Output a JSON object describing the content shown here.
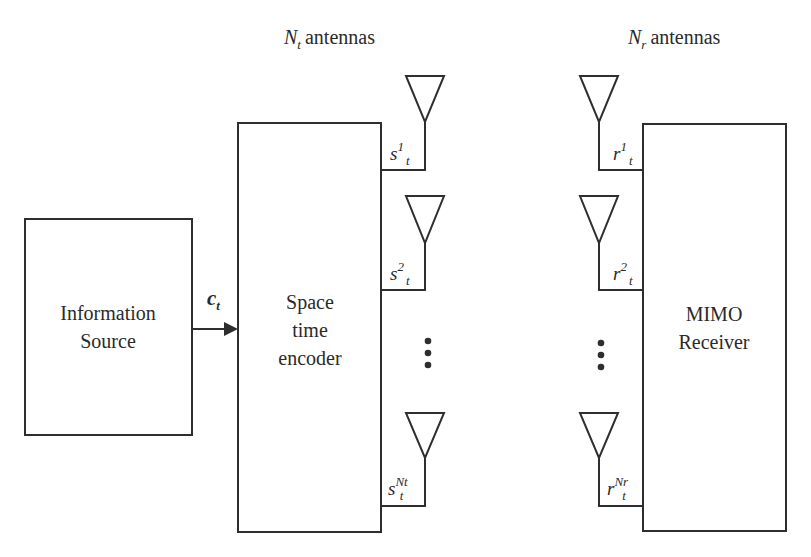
{
  "header": {
    "tx_antennas": {
      "symbol": "N",
      "subscript": "t",
      "text": "antennas"
    },
    "rx_antennas": {
      "symbol": "N",
      "subscript": "r",
      "text": "antennas"
    }
  },
  "blocks": {
    "source": {
      "line1": "Information",
      "line2": "Source"
    },
    "encoder": {
      "line1": "Space",
      "line2": "time",
      "line3": "encoder"
    },
    "receiver": {
      "line1": "MIMO",
      "line2": "Receiver"
    }
  },
  "signal": {
    "symbol": "c",
    "subscript": "t"
  },
  "tx_signals": [
    {
      "base": "s",
      "sup": "1",
      "sub": "t"
    },
    {
      "base": "s",
      "sup": "2",
      "sub": "t"
    },
    {
      "base": "s",
      "sup": "Nt",
      "sub": "t"
    }
  ],
  "rx_signals": [
    {
      "base": "r",
      "sup": "1",
      "sub": "t"
    },
    {
      "base": "r",
      "sup": "2",
      "sub": "t"
    },
    {
      "base": "r",
      "sup": "Nr",
      "sub": "t"
    }
  ],
  "ellipsis": "⋮",
  "colors": {
    "stroke": "#2e2e2e",
    "text": "#2a2a2a",
    "background": "#ffffff"
  }
}
